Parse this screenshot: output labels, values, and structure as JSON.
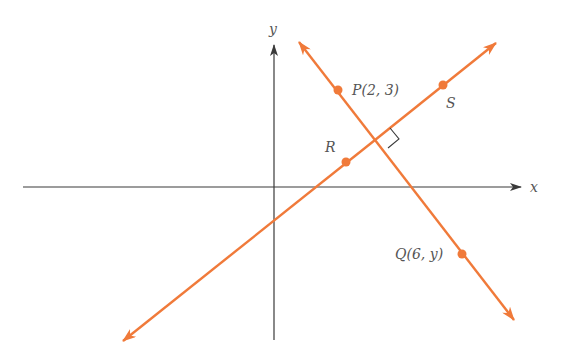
{
  "diagram": {
    "type": "coordinate-geometry",
    "colors": {
      "axes": "#3a3a3a",
      "lines": "#f07a3a",
      "points": "#f07a3a",
      "labels": "#555555",
      "right_angle_marker": "#3a3a3a"
    },
    "axes": {
      "x_label": "x",
      "y_label": "y"
    },
    "points": [
      {
        "id": "P",
        "label": "P(2, 3)",
        "x": 2,
        "y": 3
      },
      {
        "id": "Q",
        "label": "Q(6, y)",
        "x": 6,
        "y": "y"
      },
      {
        "id": "R",
        "label": "R"
      },
      {
        "id": "S",
        "label": "S"
      }
    ],
    "lines": [
      {
        "id": "line-PQ",
        "through": [
          "P",
          "Q"
        ]
      },
      {
        "id": "line-RS",
        "through": [
          "R",
          "S"
        ]
      }
    ],
    "annotations": {
      "right_angle": "PQ ⟂ RS"
    }
  }
}
